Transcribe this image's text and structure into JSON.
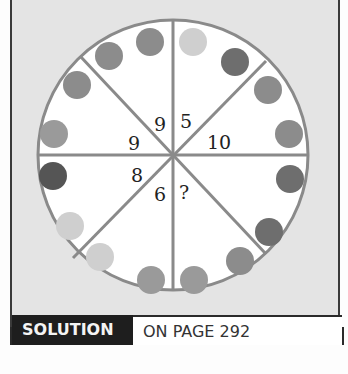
{
  "puzzle": {
    "segment_numbers": [
      "9",
      "5",
      "10",
      "?",
      "6",
      "8",
      "9"
    ],
    "numbers": {
      "upper_left_inner": "9",
      "upper_right_inner": "5",
      "right_upper": "10",
      "left_upper": "9",
      "left_lower": "8",
      "lower_left_inner": "6",
      "lower_right_inner": "?"
    },
    "colors": {
      "ring": "#8a8a8a",
      "dot_light": "#cfcfcf",
      "dot_mid": "#8c8c8c",
      "dot_midlight": "#9a9a9a",
      "dot_dark": "#6e6e6e",
      "dot_darkest": "#555555",
      "background": "#e4e4e4"
    }
  },
  "banner": {
    "label": "SOLUTION",
    "page_text": "ON PAGE 292"
  }
}
